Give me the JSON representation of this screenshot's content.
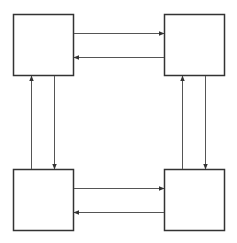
{
  "diagram": {
    "type": "four-node bidirectional cycle",
    "colors": {
      "stroke": "#333333",
      "arrow": "#555555",
      "background": "#ffffff"
    },
    "nodes": [
      {
        "id": "top-left",
        "label": ""
      },
      {
        "id": "top-right",
        "label": ""
      },
      {
        "id": "bottom-left",
        "label": ""
      },
      {
        "id": "bottom-right",
        "label": ""
      }
    ],
    "edges": [
      {
        "from": "top-left",
        "to": "top-right"
      },
      {
        "from": "top-right",
        "to": "top-left"
      },
      {
        "from": "bottom-left",
        "to": "top-left"
      },
      {
        "from": "top-left",
        "to": "bottom-left"
      },
      {
        "from": "bottom-right",
        "to": "top-right"
      },
      {
        "from": "top-right",
        "to": "bottom-right"
      },
      {
        "from": "bottom-left",
        "to": "bottom-right"
      },
      {
        "from": "bottom-right",
        "to": "bottom-left"
      }
    ]
  }
}
